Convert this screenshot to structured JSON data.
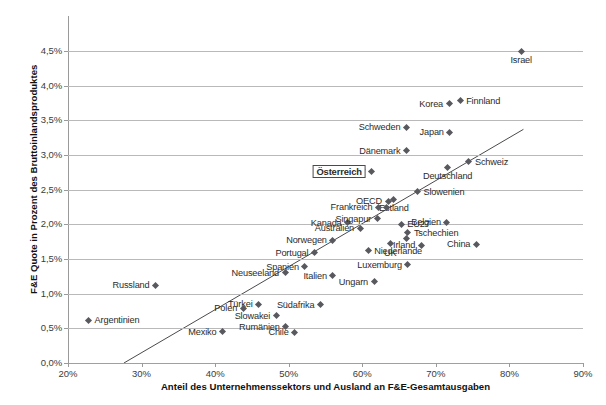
{
  "top_clipped_text": "",
  "chart_data": {
    "type": "scatter",
    "title": "",
    "xlabel": "Anteil des Unternehmenssektors und Ausland an F&E-Gesamtausgaben",
    "ylabel": "F&E Quote in Prozent des Bruttoinlandsproduktes",
    "xlim": [
      20,
      90
    ],
    "ylim": [
      0.0,
      4.75
    ],
    "xticks": [
      "20%",
      "30%",
      "40%",
      "50%",
      "60%",
      "70%",
      "80%",
      "90%"
    ],
    "xtick_values": [
      20,
      30,
      40,
      50,
      60,
      70,
      80,
      90
    ],
    "yticks": [
      "0,0%",
      "0,5%",
      "1,0%",
      "1,5%",
      "2,0%",
      "2,5%",
      "3,0%",
      "3,5%",
      "4,0%",
      "4,5%"
    ],
    "ytick_values": [
      0.0,
      0.5,
      1.0,
      1.5,
      2.0,
      2.5,
      3.0,
      3.5,
      4.0,
      4.5
    ],
    "grid": "horizontal",
    "legend": "none",
    "marker_color": "#58585f",
    "grid_color": "#b9b9b9",
    "trendline": {
      "label": "linear trend",
      "x_start": 27.6,
      "y_start": 0.0,
      "x_end": 81.9,
      "y_end": 3.37,
      "color": "#4a4a4a"
    },
    "highlight": {
      "name": "Österreich",
      "style": "boxed-bold"
    },
    "points": [
      {
        "label": "Israel",
        "x": 81.6,
        "y": 4.5,
        "label_pos": "below"
      },
      {
        "label": "Finnland",
        "x": 73.3,
        "y": 3.78,
        "label_pos": "right"
      },
      {
        "label": "Korea",
        "x": 71.8,
        "y": 3.74,
        "label_pos": "left"
      },
      {
        "label": "Japan",
        "x": 71.9,
        "y": 3.33,
        "label_pos": "left"
      },
      {
        "label": "Schweden",
        "x": 66.0,
        "y": 3.4,
        "label_pos": "left"
      },
      {
        "label": "Dänemark",
        "x": 66.0,
        "y": 3.06,
        "label_pos": "left"
      },
      {
        "label": "Schweiz",
        "x": 74.5,
        "y": 2.9,
        "label_pos": "right"
      },
      {
        "label": "USA",
        "x": 60.0,
        "y": 2.79,
        "label_pos": "left"
      },
      {
        "label": "Österreich",
        "x": 61.3,
        "y": 2.76,
        "label_pos": "boxed"
      },
      {
        "label": "Deutschland",
        "x": 71.6,
        "y": 2.82,
        "label_pos": "below"
      },
      {
        "label": "Slowenien",
        "x": 67.5,
        "y": 2.47,
        "label_pos": "right"
      },
      {
        "label": "OECD",
        "x": 63.5,
        "y": 2.33,
        "label_pos": "left"
      },
      {
        "label": "Estland",
        "x": 64.3,
        "y": 2.36,
        "label_pos": "below"
      },
      {
        "label": "Frankreich",
        "x": 62.2,
        "y": 2.25,
        "label_pos": "left"
      },
      {
        "label": "Frankreich2",
        "x": 63.3,
        "y": 2.25,
        "label_pos": "none"
      },
      {
        "label": "Kanada",
        "x": 58.0,
        "y": 2.02,
        "label_pos": "left"
      },
      {
        "label": "Singapur",
        "x": 62.0,
        "y": 2.08,
        "label_pos": "left"
      },
      {
        "label": "EU27",
        "x": 65.3,
        "y": 2.0,
        "label_pos": "right"
      },
      {
        "label": "Belgien",
        "x": 71.5,
        "y": 2.03,
        "label_pos": "left"
      },
      {
        "label": "Australien",
        "x": 59.7,
        "y": 1.94,
        "label_pos": "left"
      },
      {
        "label": "Tschechien",
        "x": 66.2,
        "y": 1.88,
        "label_pos": "right"
      },
      {
        "label": "Tschechien2",
        "x": 66.0,
        "y": 1.79,
        "label_pos": "none"
      },
      {
        "label": "Norwegen",
        "x": 56.0,
        "y": 1.77,
        "label_pos": "left"
      },
      {
        "label": "Irland",
        "x": 68.0,
        "y": 1.7,
        "label_pos": "left"
      },
      {
        "label": "China",
        "x": 75.5,
        "y": 1.71,
        "label_pos": "left"
      },
      {
        "label": "Portugal",
        "x": 53.5,
        "y": 1.59,
        "label_pos": "left"
      },
      {
        "label": "Niederlande",
        "x": 60.8,
        "y": 1.62,
        "label_pos": "right"
      },
      {
        "label": "UK",
        "x": 63.8,
        "y": 1.72,
        "label_pos": "below"
      },
      {
        "label": "Luxemburg",
        "x": 66.2,
        "y": 1.42,
        "label_pos": "left"
      },
      {
        "label": "Spanien",
        "x": 52.2,
        "y": 1.39,
        "label_pos": "left"
      },
      {
        "label": "Neuseeland",
        "x": 49.5,
        "y": 1.3,
        "label_pos": "left"
      },
      {
        "label": "Italien",
        "x": 56.0,
        "y": 1.26,
        "label_pos": "left"
      },
      {
        "label": "Ungarn",
        "x": 61.6,
        "y": 1.17,
        "label_pos": "left"
      },
      {
        "label": "Russland",
        "x": 31.9,
        "y": 1.12,
        "label_pos": "left"
      },
      {
        "label": "Türkei",
        "x": 45.9,
        "y": 0.85,
        "label_pos": "left"
      },
      {
        "label": "Südafrika",
        "x": 54.3,
        "y": 0.84,
        "label_pos": "left"
      },
      {
        "label": "Polen",
        "x": 43.8,
        "y": 0.79,
        "label_pos": "left"
      },
      {
        "label": "Slowakei",
        "x": 48.3,
        "y": 0.68,
        "label_pos": "left"
      },
      {
        "label": "Argentinien",
        "x": 22.8,
        "y": 0.62,
        "label_pos": "right"
      },
      {
        "label": "Rumänien",
        "x": 49.6,
        "y": 0.52,
        "label_pos": "left"
      },
      {
        "label": "Chile",
        "x": 50.8,
        "y": 0.44,
        "label_pos": "left"
      },
      {
        "label": "Mexiko",
        "x": 41.0,
        "y": 0.45,
        "label_pos": "left"
      }
    ]
  }
}
